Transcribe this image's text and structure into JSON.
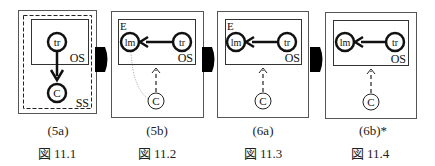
{
  "panels": [
    {
      "sublabel": "(5a)",
      "figure": "図 11.1",
      "outer_label": "SS",
      "inner_label": "OS",
      "nodes": {
        "top": "tr",
        "bottom": "C"
      }
    },
    {
      "sublabel": "(5b)",
      "figure": "図 11.2",
      "corner_label": "E",
      "inner_label": "OS",
      "nodes": {
        "left": "lm",
        "right": "tr",
        "bottom": "C"
      }
    },
    {
      "sublabel": "(6a)",
      "figure": "図 11.3",
      "corner_label": "E",
      "inner_label": "OS",
      "nodes": {
        "left": "lm",
        "right": "tr",
        "bottom": "C"
      }
    },
    {
      "sublabel": "(6b)*",
      "figure": "図 11.4",
      "inner_label": "OS",
      "nodes": {
        "left": "lm",
        "right": "tr",
        "bottom": "C"
      }
    }
  ]
}
